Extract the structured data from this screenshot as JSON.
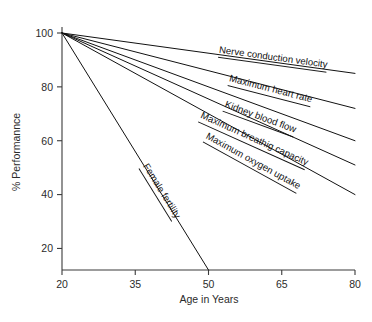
{
  "chart_data": {
    "type": "line",
    "title": "",
    "xlabel": "Age in Years",
    "ylabel": "% Performannce",
    "xlim": [
      20,
      80
    ],
    "ylim": [
      12,
      100
    ],
    "xticks": [
      20,
      35,
      50,
      65,
      80
    ],
    "xtick_labels": [
      "20",
      "35",
      "50",
      "65",
      "80"
    ],
    "yticks": [
      20,
      40,
      60,
      80,
      100
    ],
    "ytick_labels": [
      "20",
      "40",
      "60",
      "80",
      "100"
    ],
    "grid": false,
    "legend": "inline-labels-along-lines",
    "series": [
      {
        "name": "Nerve conduction velocity",
        "x": [
          20,
          80
        ],
        "y": [
          100,
          85
        ],
        "label_x": 52,
        "label_y": 91.5
      },
      {
        "name": "Maximum heart rate",
        "x": [
          20,
          80
        ],
        "y": [
          100,
          72
        ],
        "label_x": 54,
        "label_y": 81.0
      },
      {
        "name": "Kidney blood flow",
        "x": [
          20,
          80
        ],
        "y": [
          100,
          60
        ],
        "label_x": 53,
        "label_y": 71.5
      },
      {
        "name": "Maximum breathig capacity",
        "x": [
          20,
          80
        ],
        "y": [
          100,
          51
        ],
        "label_x": 48,
        "label_y": 67.5
      },
      {
        "name": "Maximum oxygen uptake",
        "x": [
          20,
          80
        ],
        "y": [
          100,
          40
        ],
        "label_x": 49,
        "label_y": 60.0
      },
      {
        "name": "Female fertility",
        "x": [
          20,
          50
        ],
        "y": [
          100,
          12
        ],
        "label_x": 36,
        "label_y": 50.0
      }
    ]
  },
  "axes": {
    "x_title": "Age in Years",
    "y_title": "% Performannce"
  },
  "colors": {
    "line": "#111111",
    "axis": "#3a3a3a",
    "text": "#2b2b2b",
    "background": "#ffffff"
  }
}
